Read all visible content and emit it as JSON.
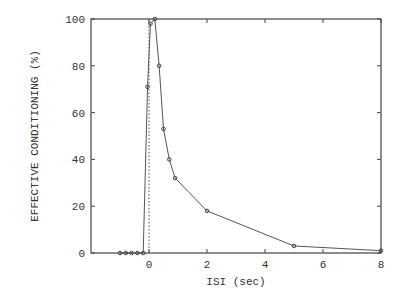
{
  "chart_data": {
    "type": "line",
    "title": "",
    "xlabel": "ISI (sec)",
    "ylabel": "EFFECTIVE CONDITIONING (%)",
    "xlim": [
      -2,
      8
    ],
    "ylim": [
      0,
      100
    ],
    "x_ticks": [
      0,
      2,
      4,
      6,
      8
    ],
    "y_ticks": [
      0,
      20,
      40,
      60,
      80,
      100
    ],
    "grid": false,
    "legend": null,
    "series": [
      {
        "name": "effective conditioning",
        "x": [
          -1.0,
          -0.8,
          -0.6,
          -0.4,
          -0.2,
          -0.05,
          0.05,
          0.2,
          0.35,
          0.5,
          0.7,
          0.9,
          2,
          5,
          8
        ],
        "y": [
          0,
          0,
          0,
          0,
          0,
          71,
          98,
          100,
          80,
          53,
          40,
          32,
          18,
          3,
          1
        ]
      }
    ],
    "annotations": [
      {
        "type": "vertical-dotted-line",
        "x": 0
      }
    ]
  }
}
